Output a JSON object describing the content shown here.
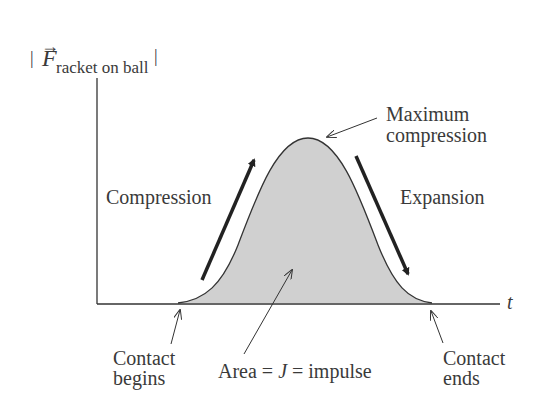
{
  "diagram": {
    "y_axis_label": {
      "bar_left": "|",
      "symbol": "F",
      "arrow": "→",
      "subscript": "racket on ball",
      "bar_right": "|"
    },
    "x_axis_label": "t",
    "annotations": {
      "compression": "Compression",
      "expansion": "Expansion",
      "max_line1": "Maximum",
      "max_line2": "compression",
      "contact_begins_line1": "Contact",
      "contact_begins_line2": "begins",
      "area_prefix": "Area = ",
      "area_symbol": "J",
      "area_suffix": " = impulse",
      "contact_ends_line1": "Contact",
      "contact_ends_line2": "ends"
    },
    "colors": {
      "fill": "#d0d0d0",
      "stroke": "#333333",
      "text": "#3a3a3a"
    }
  }
}
